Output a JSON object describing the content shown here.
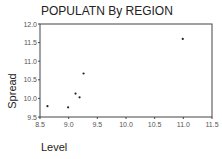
{
  "chart_data": {
    "type": "scatter",
    "title": "POPULATN By REGION",
    "xlabel": "Level",
    "ylabel": "Spread",
    "xlim": [
      8.5,
      11.5
    ],
    "ylim": [
      9.5,
      12.0
    ],
    "x_ticks": [
      "8.5",
      "9.0",
      "9.5",
      "10.0",
      "10.5",
      "11.0",
      "11.5"
    ],
    "y_ticks": [
      "9.5",
      "10.0",
      "10.5",
      "11.0",
      "11.5",
      "12.0"
    ],
    "grid": false,
    "legend": null,
    "points": [
      {
        "x": 8.63,
        "y": 9.79
      },
      {
        "x": 8.99,
        "y": 9.76
      },
      {
        "x": 9.12,
        "y": 10.13
      },
      {
        "x": 9.19,
        "y": 10.03
      },
      {
        "x": 9.26,
        "y": 10.67
      },
      {
        "x": 10.99,
        "y": 11.6
      }
    ]
  }
}
